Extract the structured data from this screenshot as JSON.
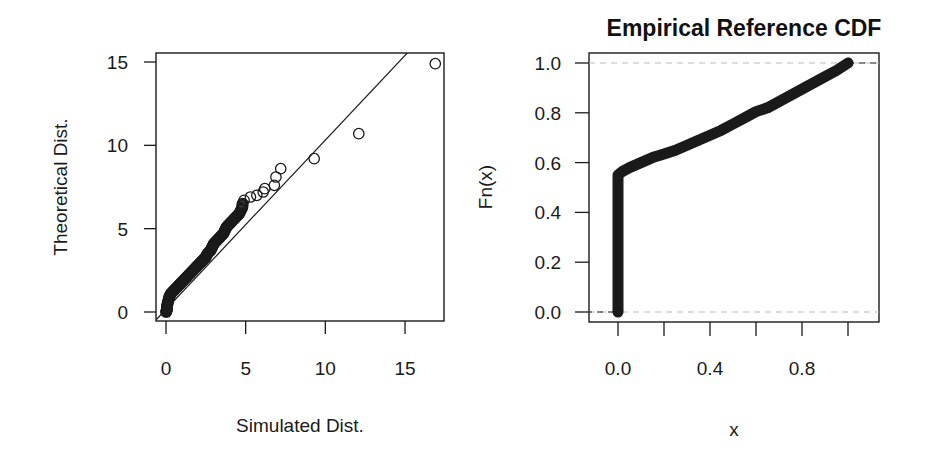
{
  "chart_data": [
    {
      "type": "scatter",
      "title": "",
      "xlabel": "Simulated Dist.",
      "ylabel": "Theoretical Dist.",
      "xlim": [
        -0.6,
        17.4
      ],
      "ylim": [
        -0.5,
        15.8
      ],
      "xticks": [
        0,
        5,
        10,
        15
      ],
      "yticks": [
        0,
        5,
        10,
        15
      ],
      "xtick_labels": [
        "0",
        "5",
        "10",
        "15"
      ],
      "ytick_labels": [
        "0",
        "5",
        "10",
        "15"
      ],
      "grid": false,
      "marker": "open-circle",
      "reference_line": {
        "from": [
          -0.6,
          -0.45
        ],
        "to": [
          15.4,
          15.8
        ],
        "label": "identity line"
      },
      "points": [
        [
          0.0,
          0.0
        ],
        [
          0.05,
          0.1
        ],
        [
          0.05,
          0.3
        ],
        [
          0.1,
          0.5
        ],
        [
          0.15,
          0.7
        ],
        [
          0.2,
          0.9
        ],
        [
          0.3,
          1.1
        ],
        [
          0.5,
          1.3
        ],
        [
          0.7,
          1.5
        ],
        [
          0.9,
          1.7
        ],
        [
          1.1,
          1.9
        ],
        [
          1.3,
          2.1
        ],
        [
          1.5,
          2.3
        ],
        [
          1.7,
          2.5
        ],
        [
          1.9,
          2.7
        ],
        [
          2.1,
          2.9
        ],
        [
          2.3,
          3.1
        ],
        [
          2.5,
          3.3
        ],
        [
          2.6,
          3.5
        ],
        [
          2.8,
          3.7
        ],
        [
          2.9,
          3.9
        ],
        [
          3.0,
          4.1
        ],
        [
          3.2,
          4.3
        ],
        [
          3.4,
          4.5
        ],
        [
          3.6,
          4.7
        ],
        [
          3.7,
          4.9
        ],
        [
          3.8,
          5.1
        ],
        [
          4.0,
          5.3
        ],
        [
          4.2,
          5.5
        ],
        [
          4.4,
          5.7
        ],
        [
          4.6,
          5.9
        ],
        [
          4.7,
          6.1
        ],
        [
          4.8,
          6.3
        ],
        [
          4.8,
          6.5
        ],
        [
          4.9,
          6.7
        ],
        [
          5.3,
          6.9
        ],
        [
          5.7,
          7.0
        ],
        [
          6.1,
          7.2
        ],
        [
          6.2,
          7.4
        ],
        [
          6.8,
          7.6
        ],
        [
          6.9,
          8.1
        ],
        [
          7.2,
          8.6
        ],
        [
          9.3,
          9.2
        ],
        [
          12.1,
          10.7
        ],
        [
          16.9,
          14.9
        ]
      ]
    },
    {
      "type": "line",
      "title": "Empirical Reference CDF",
      "xlabel": "x",
      "ylabel": "Fn(x)",
      "xlim": [
        -0.13,
        1.13
      ],
      "ylim": [
        -0.04,
        1.04
      ],
      "xticks": [
        0.0,
        0.2,
        0.4,
        0.6,
        0.8,
        1.0
      ],
      "xtick_labels": [
        "0.0",
        "",
        "0.4",
        "",
        "0.8",
        ""
      ],
      "yticks": [
        0.0,
        0.2,
        0.4,
        0.6,
        0.8,
        1.0
      ],
      "ytick_labels": [
        "0.0",
        "0.2",
        "0.4",
        "0.6",
        "0.8",
        "1.0"
      ],
      "grid": false,
      "reference_lines": [
        {
          "y": 0.0,
          "style": "dashed",
          "color": "#bbbbbb"
        },
        {
          "y": 1.0,
          "style": "dashed",
          "color": "#bbbbbb"
        }
      ],
      "marker": "thick-points",
      "x": [
        0.0,
        0.0,
        0.0,
        0.0,
        0.0,
        0.0,
        0.0,
        0.02,
        0.05,
        0.1,
        0.15,
        0.2,
        0.25,
        0.3,
        0.35,
        0.4,
        0.45,
        0.5,
        0.55,
        0.6,
        0.65,
        0.7,
        0.75,
        0.8,
        0.85,
        0.9,
        0.95,
        1.0
      ],
      "y": [
        0.0,
        0.1,
        0.2,
        0.3,
        0.4,
        0.5,
        0.55,
        0.565,
        0.58,
        0.6,
        0.62,
        0.635,
        0.65,
        0.67,
        0.69,
        0.71,
        0.73,
        0.755,
        0.78,
        0.805,
        0.82,
        0.845,
        0.87,
        0.895,
        0.92,
        0.945,
        0.97,
        1.0
      ]
    }
  ],
  "plots": {
    "left": {
      "xlabel": "Simulated Dist.",
      "ylabel": "Theoretical Dist.",
      "xticks": [
        "0",
        "5",
        "10",
        "15"
      ],
      "yticks": [
        "0",
        "5",
        "10",
        "15"
      ]
    },
    "right": {
      "title": "Empirical Reference CDF",
      "xlabel": "x",
      "ylabel": "Fn(x)",
      "xticks": [
        "0.0",
        "0.4",
        "0.8"
      ],
      "yticks": [
        "0.0",
        "0.2",
        "0.4",
        "0.6",
        "0.8",
        "1.0"
      ]
    }
  },
  "colors": {
    "ink": "#1a1a1a",
    "dashed_ref": "#bbbbbb",
    "background": "#ffffff"
  }
}
